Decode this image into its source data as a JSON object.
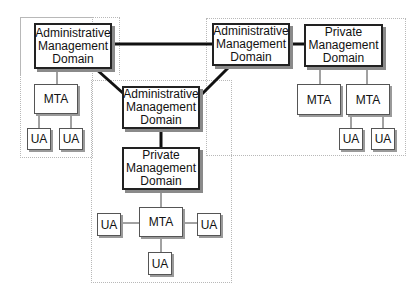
{
  "colors": {
    "thick_line": "#111111",
    "thin_line": "#444444",
    "region_border": "#b8b8b8",
    "shadow": "#8a8a8a"
  },
  "regions": {
    "left": "left-domain-region",
    "right": "right-domain-region",
    "center": "center-domain-region"
  },
  "nodes": {
    "admin_left": "Administrative\nManagement\nDomain",
    "admin_right": "Administrative\nManagement\nDomain",
    "admin_center": "Administrative\nManagement\nDomain",
    "private_right": "Private\nManagement\nDomain",
    "private_center": "Private\nManagement\nDomain",
    "mta_left": "MTA",
    "mta_right_1": "MTA",
    "mta_right_2": "MTA",
    "mta_center": "MTA",
    "ua_left_1": "UA",
    "ua_left_2": "UA",
    "ua_right_1": "UA",
    "ua_right_2": "UA",
    "ua_center_left": "UA",
    "ua_center_right": "UA",
    "ua_center_bottom": "UA"
  }
}
